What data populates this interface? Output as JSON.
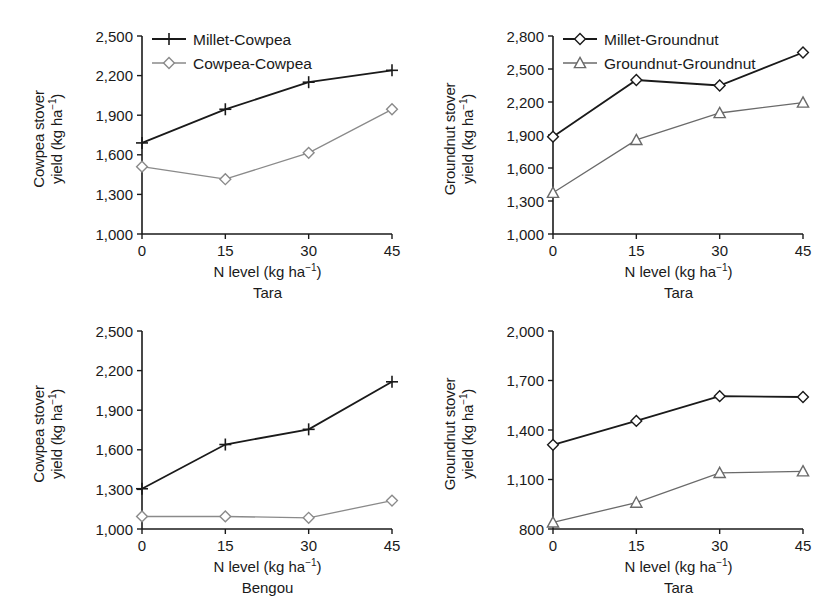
{
  "figure": {
    "xlabel_main": "N level (kg ha",
    "xlabel_sup": "−1",
    "xlabel_tail": ")"
  },
  "panels": [
    {
      "key": "top-left",
      "ylabel_line1": "Cowpea stover",
      "ylabel_line2": "yield (kg ha",
      "ylabel_sup": "−1",
      "ylabel_tail": ")",
      "xlabel": "N level (kg ha⁻¹)",
      "caption": "Tara",
      "ylim": [
        1000,
        2500
      ],
      "yticks": [
        1000,
        1300,
        1600,
        1900,
        2200,
        2500
      ],
      "yticklabels": [
        "1,000",
        "1,300",
        "1,600",
        "1,900",
        "2,200",
        "2,500"
      ],
      "xticks": [
        0,
        15,
        30,
        45
      ],
      "xticklabels": [
        "0",
        "15",
        "30",
        "45"
      ],
      "legend": [
        {
          "name": "Millet-Cowpea",
          "marker": "plus",
          "color": "#1a1a1a"
        },
        {
          "name": "Cowpea-Cowpea",
          "marker": "diamond",
          "color": "#8a8a8a"
        }
      ],
      "series": [
        {
          "name": "Millet-Cowpea",
          "marker": "plus",
          "color": "#1a1a1a",
          "values": [
            1690,
            1945,
            2150,
            2240
          ]
        },
        {
          "name": "Cowpea-Cowpea",
          "marker": "diamond",
          "color": "#8a8a8a",
          "values": [
            1510,
            1415,
            1615,
            1945
          ]
        }
      ]
    },
    {
      "key": "top-right",
      "ylabel_line1": "Groundnut stover",
      "ylabel_line2": "yield (kg ha",
      "ylabel_sup": "−1",
      "ylabel_tail": ")",
      "xlabel": "N level (kg ha⁻¹)",
      "caption": "Tara",
      "ylim": [
        1000,
        2800
      ],
      "yticks": [
        1000,
        1300,
        1600,
        1900,
        2200,
        2500,
        2800
      ],
      "yticklabels": [
        "1,000",
        "1,300",
        "1,600",
        "1,900",
        "2,200",
        "2,500",
        "2,800"
      ],
      "xticks": [
        0,
        15,
        30,
        45
      ],
      "xticklabels": [
        "0",
        "15",
        "30",
        "45"
      ],
      "legend": [
        {
          "name": "Millet-Groundnut",
          "marker": "diamond",
          "color": "#1a1a1a"
        },
        {
          "name": "Groundnut-Groundnut",
          "marker": "triangle",
          "color": "#6a6a6a"
        }
      ],
      "series": [
        {
          "name": "Millet-Groundnut",
          "marker": "diamond",
          "color": "#1a1a1a",
          "values": [
            1885,
            2400,
            2350,
            2650
          ]
        },
        {
          "name": "Groundnut-Groundnut",
          "marker": "triangle",
          "color": "#6a6a6a",
          "values": [
            1375,
            1855,
            2100,
            2195
          ]
        }
      ]
    },
    {
      "key": "bottom-left",
      "ylabel_line1": "Cowpea stover",
      "ylabel_line2": "yield (kg ha",
      "ylabel_sup": "−1",
      "ylabel_tail": ")",
      "xlabel": "N level (kg ha⁻¹)",
      "caption": "Bengou",
      "ylim": [
        1000,
        2500
      ],
      "yticks": [
        1000,
        1300,
        1600,
        1900,
        2200,
        2500
      ],
      "yticklabels": [
        "1,000",
        "1,300",
        "1,600",
        "1,900",
        "2,200",
        "2,500"
      ],
      "xticks": [
        0,
        15,
        30,
        45
      ],
      "xticklabels": [
        "0",
        "15",
        "30",
        "45"
      ],
      "legend": [],
      "series": [
        {
          "name": "Millet-Cowpea",
          "marker": "plus",
          "color": "#1a1a1a",
          "values": [
            1305,
            1640,
            1755,
            2115
          ]
        },
        {
          "name": "Cowpea-Cowpea",
          "marker": "diamond",
          "color": "#8a8a8a",
          "values": [
            1095,
            1095,
            1085,
            1215
          ]
        }
      ]
    },
    {
      "key": "bottom-right",
      "ylabel_line1": "Groundnut stover",
      "ylabel_line2": "yield (kg ha",
      "ylabel_sup": "−1",
      "ylabel_tail": ")",
      "xlabel": "N level (kg ha⁻¹)",
      "caption": "Tara",
      "ylim": [
        800,
        2000
      ],
      "yticks": [
        800,
        1100,
        1400,
        1700,
        2000
      ],
      "yticklabels": [
        "800",
        "1,100",
        "1,400",
        "1,700",
        "2,000"
      ],
      "xticks": [
        0,
        15,
        30,
        45
      ],
      "xticklabels": [
        "0",
        "15",
        "30",
        "45"
      ],
      "legend": [],
      "series": [
        {
          "name": "Millet-Groundnut",
          "marker": "diamond",
          "color": "#1a1a1a",
          "values": [
            1310,
            1455,
            1605,
            1600
          ]
        },
        {
          "name": "Groundnut-Groundnut",
          "marker": "triangle",
          "color": "#6a6a6a",
          "values": [
            840,
            960,
            1140,
            1150
          ]
        }
      ]
    }
  ],
  "chart_data": {
    "type": "line",
    "title": "",
    "xlabel": "N level (kg ha⁻¹)",
    "x": [
      0,
      15,
      30,
      45
    ],
    "panels": [
      {
        "panel": "top-left",
        "caption": "Tara",
        "ylabel": "Cowpea stover yield (kg ha⁻¹)",
        "ylim": [
          1000,
          2500
        ],
        "grid": false,
        "legend_position": "top-left-inside",
        "series": [
          {
            "name": "Millet-Cowpea",
            "values": [
              1690,
              1945,
              2150,
              2240
            ]
          },
          {
            "name": "Cowpea-Cowpea",
            "values": [
              1510,
              1415,
              1615,
              1945
            ]
          }
        ]
      },
      {
        "panel": "top-right",
        "caption": "Tara",
        "ylabel": "Groundnut stover yield (kg ha⁻¹)",
        "ylim": [
          1000,
          2800
        ],
        "grid": false,
        "legend_position": "top-left-inside",
        "series": [
          {
            "name": "Millet-Groundnut",
            "values": [
              1885,
              2400,
              2350,
              2650
            ]
          },
          {
            "name": "Groundnut-Groundnut",
            "values": [
              1375,
              1855,
              2100,
              2195
            ]
          }
        ]
      },
      {
        "panel": "bottom-left",
        "caption": "Bengou",
        "ylabel": "Cowpea stover yield (kg ha⁻¹)",
        "ylim": [
          1000,
          2500
        ],
        "grid": false,
        "legend_position": "none",
        "series": [
          {
            "name": "Millet-Cowpea",
            "values": [
              1305,
              1640,
              1755,
              2115
            ]
          },
          {
            "name": "Cowpea-Cowpea",
            "values": [
              1095,
              1095,
              1085,
              1215
            ]
          }
        ]
      },
      {
        "panel": "bottom-right",
        "caption": "Tara",
        "ylabel": "Groundnut stover yield (kg ha⁻¹)",
        "ylim": [
          800,
          2000
        ],
        "grid": false,
        "legend_position": "none",
        "series": [
          {
            "name": "Millet-Groundnut",
            "values": [
              1310,
              1455,
              1605,
              1600
            ]
          },
          {
            "name": "Groundnut-Groundnut",
            "values": [
              840,
              960,
              1140,
              1150
            ]
          }
        ]
      }
    ]
  }
}
